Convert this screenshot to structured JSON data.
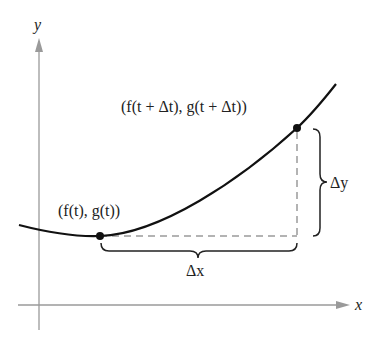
{
  "diagram": {
    "axes": {
      "x_label": "x",
      "y_label": "y",
      "axis_color": "#9a9a9a"
    },
    "curve_color": "#111111",
    "dash_color": "#9a9a9a",
    "points": [
      {
        "label": "(f(t), g(t))",
        "x": 100,
        "y": 236
      },
      {
        "label": "(f(t + Δt), g(t + Δt))",
        "x": 297,
        "y": 128
      }
    ],
    "braces": {
      "dx_label": "Δx",
      "dy_label": "Δy"
    }
  }
}
